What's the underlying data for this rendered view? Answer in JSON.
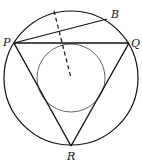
{
  "diagram": {
    "type": "geometry",
    "outer_circle": {
      "cx": 71,
      "cy": 78,
      "r": 67
    },
    "inner_circle": {
      "cx": 71,
      "cy": 78,
      "r": 34
    },
    "points": {
      "P": {
        "label": "P",
        "x": 14,
        "y": 43
      },
      "Q": {
        "label": "Q",
        "x": 129,
        "y": 43
      },
      "R": {
        "label": "R",
        "x": 71,
        "y": 146
      },
      "B": {
        "label": "B",
        "x": 107,
        "y": 19
      }
    },
    "segments": [
      {
        "from": "P",
        "to": "Q",
        "style": "solid"
      },
      {
        "from": "Q",
        "to": "R",
        "style": "solid"
      },
      {
        "from": "R",
        "to": "P",
        "style": "solid"
      },
      {
        "from": "P",
        "to": "B",
        "style": "solid"
      }
    ],
    "dashed_line": {
      "x1": 54,
      "y1": 11,
      "x2": 71,
      "y2": 78
    },
    "colors": {
      "stroke": "#111111",
      "inner_stroke": "#555555",
      "background": "#ffffff"
    }
  }
}
